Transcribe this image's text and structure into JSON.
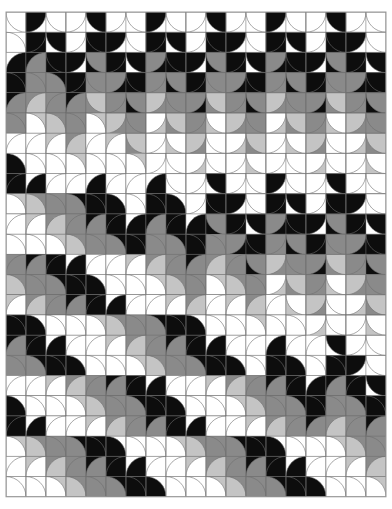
{
  "artwork": {
    "description": "Op-art pattern of interlocking semicircles (fish-scale motif) in black, gray and white; vertical scale columns in the upper-right meet horizontal scale rows in the lower-left along a stepped diagonal",
    "canvas": {
      "width": 392,
      "height": 509,
      "background": "#ffffff"
    },
    "grid": {
      "x0": 6,
      "y0": 12,
      "cols": 19,
      "rows": 24,
      "cell_w": 20.0,
      "cell_h": 20.2
    },
    "palette": {
      "black": "#0d0d0d",
      "gray": "#8a8a8a",
      "light_gray": "#c4c4c4",
      "white": "#ffffff",
      "line": "#6e6e6e"
    },
    "tones": [
      "black",
      "white",
      "gray",
      "white",
      "light_gray",
      "black",
      "white",
      "gray"
    ]
  }
}
